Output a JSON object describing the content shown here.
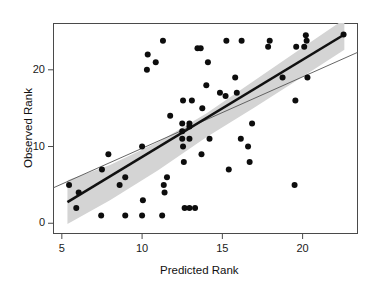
{
  "chart_data": {
    "type": "scatter",
    "title": "",
    "xlabel": "Predicted Rank",
    "ylabel": "Observed Rank",
    "xlim": [
      4.45,
      23.45
    ],
    "ylim": [
      -1.4,
      26.1
    ],
    "xticks": [
      5,
      10,
      15,
      20
    ],
    "xtick_labels": [
      "5",
      "10",
      "15",
      "20"
    ],
    "yticks": [
      0,
      10,
      20
    ],
    "ytick_labels": [
      "0",
      "10",
      "20"
    ],
    "grid": false,
    "legend": "none",
    "point_color": "#0d0d0d",
    "point_size": 3.0,
    "fit_line_color": "#111111",
    "reference_line_color": "#555555",
    "confidence_band_color": "#d4d4d4",
    "points": [
      {
        "x": 5.45,
        "y": 5.0
      },
      {
        "x": 5.9,
        "y": 2.0
      },
      {
        "x": 6.05,
        "y": 4.0
      },
      {
        "x": 7.5,
        "y": 7.0
      },
      {
        "x": 7.9,
        "y": 9.0
      },
      {
        "x": 7.45,
        "y": 1.0
      },
      {
        "x": 8.6,
        "y": 5.0
      },
      {
        "x": 8.95,
        "y": 6.0
      },
      {
        "x": 8.95,
        "y": 1.0
      },
      {
        "x": 10.0,
        "y": 10.0
      },
      {
        "x": 10.0,
        "y": 1.0
      },
      {
        "x": 10.05,
        "y": 3.0
      },
      {
        "x": 10.3,
        "y": 20.0
      },
      {
        "x": 10.35,
        "y": 22.0
      },
      {
        "x": 10.85,
        "y": 21.0
      },
      {
        "x": 11.25,
        "y": 1.0
      },
      {
        "x": 11.3,
        "y": 23.8
      },
      {
        "x": 11.35,
        "y": 5.0
      },
      {
        "x": 11.4,
        "y": 4.0
      },
      {
        "x": 11.55,
        "y": 6.0
      },
      {
        "x": 11.75,
        "y": 14.0
      },
      {
        "x": 12.5,
        "y": 13.0
      },
      {
        "x": 12.5,
        "y": 12.0
      },
      {
        "x": 12.5,
        "y": 11.0
      },
      {
        "x": 12.55,
        "y": 16.0
      },
      {
        "x": 12.55,
        "y": 10.0
      },
      {
        "x": 12.6,
        "y": 8.0
      },
      {
        "x": 12.65,
        "y": 2.0
      },
      {
        "x": 12.95,
        "y": 13.0
      },
      {
        "x": 12.95,
        "y": 12.6
      },
      {
        "x": 12.95,
        "y": 11.0
      },
      {
        "x": 12.95,
        "y": 2.0
      },
      {
        "x": 13.1,
        "y": 16.0
      },
      {
        "x": 13.3,
        "y": 2.0
      },
      {
        "x": 13.45,
        "y": 22.8
      },
      {
        "x": 13.65,
        "y": 22.8
      },
      {
        "x": 13.7,
        "y": 9.0
      },
      {
        "x": 13.75,
        "y": 15.0
      },
      {
        "x": 14.0,
        "y": 18.0
      },
      {
        "x": 14.1,
        "y": 21.0
      },
      {
        "x": 14.2,
        "y": 11.0
      },
      {
        "x": 14.85,
        "y": 17.0
      },
      {
        "x": 15.2,
        "y": 16.6
      },
      {
        "x": 15.25,
        "y": 23.8
      },
      {
        "x": 15.4,
        "y": 7.0
      },
      {
        "x": 15.8,
        "y": 19.0
      },
      {
        "x": 15.9,
        "y": 17.0
      },
      {
        "x": 16.15,
        "y": 11.0
      },
      {
        "x": 16.2,
        "y": 23.8
      },
      {
        "x": 16.6,
        "y": 10.0
      },
      {
        "x": 16.7,
        "y": 8.0
      },
      {
        "x": 16.85,
        "y": 13.0
      },
      {
        "x": 17.85,
        "y": 23.0
      },
      {
        "x": 17.95,
        "y": 23.8
      },
      {
        "x": 18.75,
        "y": 19.0
      },
      {
        "x": 19.5,
        "y": 5.0
      },
      {
        "x": 19.55,
        "y": 16.0
      },
      {
        "x": 19.6,
        "y": 23.0
      },
      {
        "x": 20.1,
        "y": 23.0
      },
      {
        "x": 20.2,
        "y": 24.5
      },
      {
        "x": 20.25,
        "y": 23.8
      },
      {
        "x": 20.3,
        "y": 19.0
      },
      {
        "x": 22.55,
        "y": 24.6
      }
    ],
    "fit_line": {
      "x0": 5.35,
      "y0": 2.75,
      "x1": 22.6,
      "y1": 24.6
    },
    "reference_line": {
      "x0": 4.45,
      "y0": 4.6,
      "x1": 23.45,
      "y1": 22.3
    },
    "confidence_band_upper": [
      {
        "x": 5.35,
        "y": 5.6
      },
      {
        "x": 8.0,
        "y": 7.6
      },
      {
        "x": 11.0,
        "y": 10.6
      },
      {
        "x": 14.0,
        "y": 14.3
      },
      {
        "x": 17.0,
        "y": 18.6
      },
      {
        "x": 20.0,
        "y": 22.9
      },
      {
        "x": 22.6,
        "y": 26.6
      }
    ],
    "confidence_band_lower": [
      {
        "x": 5.35,
        "y": -0.1
      },
      {
        "x": 8.0,
        "y": 3.0
      },
      {
        "x": 11.0,
        "y": 6.9
      },
      {
        "x": 14.0,
        "y": 11.2
      },
      {
        "x": 17.0,
        "y": 15.1
      },
      {
        "x": 20.0,
        "y": 19.1
      },
      {
        "x": 22.6,
        "y": 22.6
      }
    ]
  }
}
